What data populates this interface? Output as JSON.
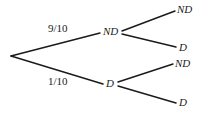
{
  "diagram": {
    "type": "probability-tree",
    "branch_labels": [
      {
        "id": "p-top",
        "text": "9/10",
        "x": 48,
        "y": 23
      },
      {
        "id": "p-bottom",
        "text": "1/10",
        "x": 48,
        "y": 76
      }
    ],
    "internal_nodes": [
      {
        "id": "node-nd",
        "text": "ND",
        "x": 103,
        "y": 26
      },
      {
        "id": "node-d",
        "text": "D",
        "x": 106,
        "y": 78
      }
    ],
    "leaf_nodes": [
      {
        "id": "leaf-nd-nd",
        "text": "ND",
        "x": 177,
        "y": 4
      },
      {
        "id": "leaf-nd-d",
        "text": "D",
        "x": 179,
        "y": 42
      },
      {
        "id": "leaf-d-nd",
        "text": "ND",
        "x": 175,
        "y": 58
      },
      {
        "id": "leaf-d-d",
        "text": "D",
        "x": 179,
        "y": 97
      }
    ],
    "edges": [
      {
        "id": "edge-root-nd",
        "x1": 11,
        "y1": 56,
        "x2": 100,
        "y2": 33
      },
      {
        "id": "edge-root-d",
        "x1": 11,
        "y1": 56,
        "x2": 103,
        "y2": 84
      },
      {
        "id": "edge-nd-nd",
        "x1": 122,
        "y1": 31,
        "x2": 175,
        "y2": 11
      },
      {
        "id": "edge-nd-d",
        "x1": 122,
        "y1": 34,
        "x2": 176,
        "y2": 47
      },
      {
        "id": "edge-d-nd",
        "x1": 118,
        "y1": 82,
        "x2": 173,
        "y2": 64
      },
      {
        "id": "edge-d-d",
        "x1": 118,
        "y1": 86,
        "x2": 176,
        "y2": 103
      }
    ],
    "stroke_color": "#1a1a1a",
    "stroke_width": 1.4,
    "background_color": "#ffffff"
  }
}
